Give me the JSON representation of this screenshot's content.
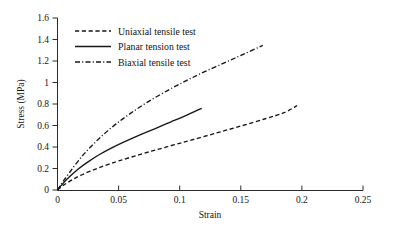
{
  "chart_data": {
    "type": "line",
    "title": "",
    "xlabel": "Strain",
    "ylabel": "Stress (MPa)",
    "xlim": [
      0,
      0.25
    ],
    "ylim": [
      0,
      1.6
    ],
    "xticks": [
      "0",
      "0.05",
      "0.1",
      "0.15",
      "0.2",
      "0.25"
    ],
    "xtick_values": [
      0,
      0.05,
      0.1,
      0.15,
      0.2,
      0.25
    ],
    "yticks": [
      "0",
      "0.2",
      "0.4",
      "0.6",
      "0.8",
      "1",
      "1.2",
      "1.4",
      "1.6"
    ],
    "ytick_values": [
      0,
      0.2,
      0.4,
      0.6,
      0.8,
      1.0,
      1.2,
      1.4,
      1.6
    ],
    "grid": false,
    "legend_position": "upper-left-inside",
    "line_color": "#161616",
    "axis_color": "#2b2b2b",
    "series": [
      {
        "name": "Uniaxial tensile test",
        "style": "dashed",
        "x": [
          0,
          0.005,
          0.012,
          0.02,
          0.03,
          0.04,
          0.05,
          0.065,
          0.08,
          0.095,
          0.11,
          0.13,
          0.15,
          0.17,
          0.185,
          0.196
        ],
        "values": [
          0,
          0.045,
          0.095,
          0.142,
          0.19,
          0.232,
          0.27,
          0.322,
          0.371,
          0.419,
          0.466,
          0.53,
          0.595,
          0.663,
          0.717,
          0.785
        ]
      },
      {
        "name": "Planar tension test",
        "style": "solid",
        "x": [
          0,
          0.004,
          0.01,
          0.017,
          0.025,
          0.034,
          0.044,
          0.055,
          0.067,
          0.08,
          0.092,
          0.104,
          0.118
        ],
        "values": [
          0,
          0.055,
          0.125,
          0.196,
          0.262,
          0.328,
          0.39,
          0.45,
          0.51,
          0.572,
          0.63,
          0.687,
          0.76
        ]
      },
      {
        "name": "Biaxial tensile test",
        "style": "dash-dot",
        "x": [
          0,
          0.004,
          0.01,
          0.018,
          0.027,
          0.037,
          0.048,
          0.06,
          0.074,
          0.09,
          0.105,
          0.12,
          0.137,
          0.152,
          0.168
        ],
        "values": [
          0,
          0.07,
          0.165,
          0.285,
          0.4,
          0.51,
          0.615,
          0.715,
          0.82,
          0.925,
          1.015,
          1.098,
          1.185,
          1.262,
          1.345
        ]
      }
    ]
  },
  "legend": {
    "items": [
      {
        "label": "Uniaxial tensile test",
        "style": "dashed"
      },
      {
        "label": "Planar tension test",
        "style": "solid"
      },
      {
        "label": "Biaxial tensile test",
        "style": "dash-dot"
      }
    ]
  }
}
